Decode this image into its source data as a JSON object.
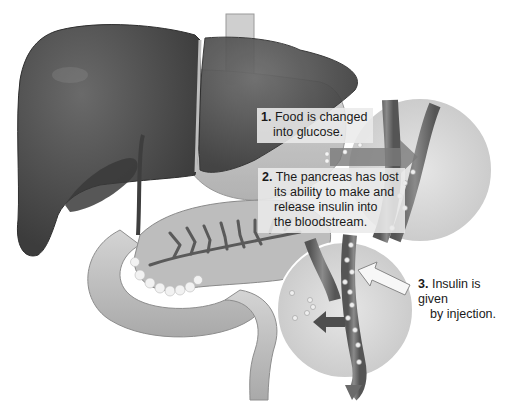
{
  "diagram": {
    "title_fragment": "",
    "organs": [
      "liver",
      "stomach",
      "gallbladder",
      "pancreas",
      "duodenum",
      "esophagus",
      "blood vessel"
    ],
    "callouts": [
      {
        "number": "1.",
        "line1": "Food is changed",
        "line2": "into glucose."
      },
      {
        "number": "2.",
        "line1": "The pancreas has lost",
        "line2": "its ability to make and",
        "line3": "release insulin into",
        "line4": "the bloodstream."
      },
      {
        "number": "3.",
        "line1": "Insulin is given",
        "line2": "by injection."
      }
    ],
    "colors": {
      "liver": "#4a4a4a",
      "organ_light": "#c8c8c8",
      "organ_mid": "#a8a8a8",
      "vessel": "#6e6e6e",
      "inset_bg": "#dcdcdc",
      "caption_box": "#ebebeb"
    }
  }
}
